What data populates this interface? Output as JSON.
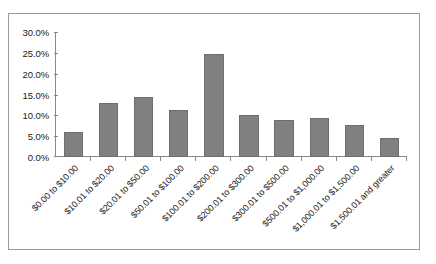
{
  "chart_data": {
    "type": "bar",
    "title": "",
    "subtitle": "",
    "xlabel": "",
    "ylabel": "",
    "ylim": [
      0,
      30
    ],
    "y_ticks": [
      "0.0%",
      "5.0%",
      "10.0%",
      "15.0%",
      "20.0%",
      "25.0%",
      "30.0%"
    ],
    "y_tick_values": [
      0,
      5,
      10,
      15,
      20,
      25,
      30
    ],
    "grid": false,
    "legend": null,
    "legend_position": "none",
    "categories": [
      "$0.00 to $10.00",
      "$10.01 to $20.00",
      "$20.01 to $50.00",
      "$50.01 to $100.00",
      "$100.01 to $200.00",
      "$200.01 to $300.00",
      "$300.01 to $500.00",
      "$500.01 to $1,000.00",
      "$1,000.01 to $1,500.00",
      "$1,500.01 and greater"
    ],
    "values": [
      6.0,
      13.0,
      14.3,
      11.4,
      24.8,
      10.0,
      9.0,
      9.3,
      7.7,
      4.5
    ],
    "value_labels": [
      "6.0%",
      "13.0%",
      "14.3%",
      "11.4%",
      "24.8%",
      "10.0%",
      "9.0%",
      "9.3%",
      "7.7%",
      "4.5%"
    ],
    "bar_color": "#808080",
    "bar_border_color": "#6e6e6e",
    "axis_color": "#8a8a8a",
    "frame_color": "#9a9a9a",
    "background_color": "#ffffff",
    "x_label_rotation": "-45"
  }
}
